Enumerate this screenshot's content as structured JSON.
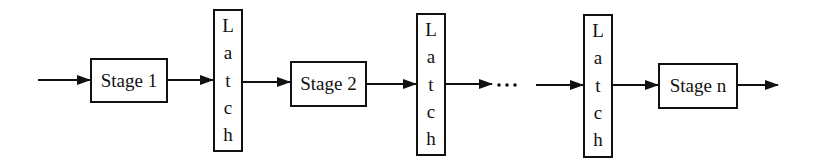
{
  "diagram": {
    "type": "pipeline",
    "stages": [
      {
        "label": "Stage 1"
      },
      {
        "label": "Stage 2"
      },
      {
        "label": "Stage n"
      }
    ],
    "latches": [
      {
        "label": "Latch",
        "letters": [
          "L",
          "a",
          "t",
          "c",
          "h"
        ]
      },
      {
        "label": "Latch",
        "letters": [
          "L",
          "a",
          "t",
          "c",
          "h"
        ]
      },
      {
        "label": "Latch",
        "letters": [
          "L",
          "a",
          "t",
          "c",
          "h"
        ]
      }
    ],
    "ellipsis": "...",
    "colors": {
      "stroke": "#111111",
      "background": "#ffffff"
    }
  }
}
